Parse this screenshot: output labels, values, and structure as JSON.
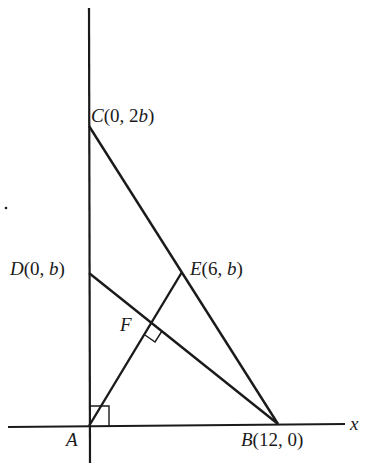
{
  "diagram": {
    "colors": {
      "line": "#1a1a1a",
      "background": "#ffffff"
    },
    "axes": {
      "x_label": "x"
    },
    "points": {
      "A": {
        "name": "A",
        "coords": "",
        "px": [
          89,
          426
        ]
      },
      "B": {
        "name": "B",
        "coords": "(12, 0)",
        "px": [
          278,
          424
        ]
      },
      "C": {
        "name": "C",
        "coords": "(0, 2",
        "coords_var": "b",
        "coords_end": ")",
        "px": [
          89,
          126
        ]
      },
      "D": {
        "name": "D",
        "coords": "(0, ",
        "coords_var": "b",
        "coords_end": ")",
        "px": [
          89,
          273
        ]
      },
      "E": {
        "name": "E",
        "coords": "(6, ",
        "coords_var": "b",
        "coords_end": ")",
        "px": [
          182,
          272
        ]
      },
      "F": {
        "name": "F",
        "coords": "",
        "px": [
          152,
          323
        ]
      }
    },
    "segments": [
      {
        "from": "C",
        "to": "B"
      },
      {
        "from": "D",
        "to": "B"
      },
      {
        "from": "A",
        "to": "E"
      }
    ],
    "right_angles": [
      {
        "at": "A",
        "between": [
          "x-axis",
          "AE"
        ]
      },
      {
        "at": "F",
        "between": [
          "AE",
          "DB"
        ]
      }
    ]
  }
}
